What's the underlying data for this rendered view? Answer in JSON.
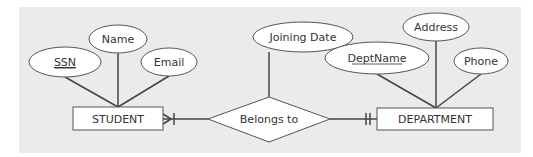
{
  "diagram": {
    "type": "entity-relationship",
    "colors": {
      "background": "#ffffff",
      "panel": "#ebebeb",
      "shape_fill": "#ffffff",
      "stroke": "#444444",
      "text": "#333333"
    },
    "entities": [
      {
        "id": "student",
        "label": "STUDENT"
      },
      {
        "id": "department",
        "label": "DEPARTMENT"
      }
    ],
    "relationship": {
      "id": "belongs_to",
      "label": "Belongs to",
      "attribute": "Joining Date"
    },
    "attributes": {
      "student": [
        {
          "label": "SSN",
          "key": true
        },
        {
          "label": "Name",
          "key": false
        },
        {
          "label": "Email",
          "key": false
        }
      ],
      "department": [
        {
          "label": "DeptName",
          "key": true
        },
        {
          "label": "Address",
          "key": false
        },
        {
          "label": "Phone",
          "key": false
        }
      ]
    },
    "cardinality": {
      "student_side": "one-or-many",
      "department_side": "one-and-only-one"
    }
  }
}
